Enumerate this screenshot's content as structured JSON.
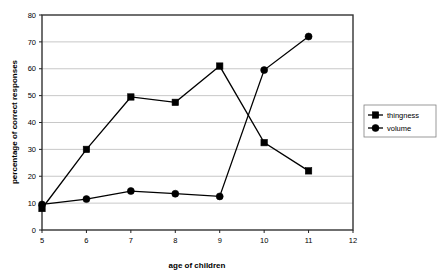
{
  "chart_data": {
    "type": "line",
    "title": "",
    "xlabel": "age of children",
    "ylabel": "percentage of correct responses",
    "x": [
      5,
      6,
      7,
      8,
      9,
      10,
      11
    ],
    "xlim": [
      5,
      12
    ],
    "ylim": [
      0,
      80
    ],
    "xticks": [
      "5",
      "6",
      "7",
      "8",
      "9",
      "10",
      "11",
      "12"
    ],
    "xtick_values": [
      5,
      6,
      7,
      8,
      9,
      10,
      11,
      12
    ],
    "yticks": [
      "0",
      "10",
      "20",
      "30",
      "40",
      "50",
      "60",
      "70",
      "80"
    ],
    "ytick_values": [
      0,
      10,
      20,
      30,
      40,
      50,
      60,
      70,
      80
    ],
    "grid": "horizontal",
    "legend_position": "right",
    "series": [
      {
        "name": "thingness",
        "marker": "square",
        "color": "#000000",
        "values": [
          8,
          30,
          49.5,
          47.5,
          61,
          32.5,
          22
        ]
      },
      {
        "name": "volume",
        "marker": "circle",
        "color": "#000000",
        "values": [
          9.5,
          11.5,
          14.5,
          13.5,
          12.5,
          59.5,
          72
        ]
      }
    ]
  },
  "legend": {
    "items": [
      {
        "label": "thingness",
        "marker": "square"
      },
      {
        "label": "volume",
        "marker": "circle"
      }
    ]
  },
  "axes": {
    "x_title": "age of children",
    "y_title": "percentage of correct responses"
  }
}
